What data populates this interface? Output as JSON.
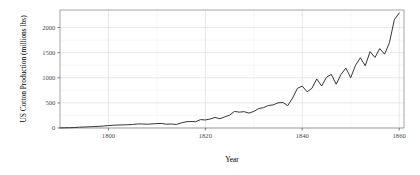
{
  "chart_data": {
    "type": "line",
    "title": "",
    "subtitle": "",
    "xlabel": "Year",
    "ylabel": "US Cotton Production (millions lbs)",
    "xlim": [
      1790,
      1861
    ],
    "ylim": [
      0,
      2350
    ],
    "xticks": [
      1800,
      1820,
      1840,
      1860
    ],
    "xtick_labels": [
      "1800",
      "1820",
      "1840",
      "1860"
    ],
    "yticks": [
      0,
      500,
      1000,
      1500,
      2000
    ],
    "ytick_labels": [
      "0",
      "500",
      "1000",
      "1500",
      "2000"
    ],
    "y_minor_ticks": [
      250,
      750,
      1250,
      1750,
      2250
    ],
    "x_minor_ticks": [
      1810,
      1830,
      1850
    ],
    "grid": true,
    "legend": "none",
    "series": [
      {
        "name": "US Cotton Production",
        "color": "#2b2b2b",
        "x": [
          1790,
          1791,
          1792,
          1793,
          1794,
          1795,
          1796,
          1797,
          1798,
          1799,
          1800,
          1801,
          1802,
          1803,
          1804,
          1805,
          1806,
          1807,
          1808,
          1809,
          1810,
          1811,
          1812,
          1813,
          1814,
          1815,
          1816,
          1817,
          1818,
          1819,
          1820,
          1821,
          1822,
          1823,
          1824,
          1825,
          1826,
          1827,
          1828,
          1829,
          1830,
          1831,
          1832,
          1833,
          1834,
          1835,
          1836,
          1837,
          1838,
          1839,
          1840,
          1841,
          1842,
          1843,
          1844,
          1845,
          1846,
          1847,
          1848,
          1849,
          1850,
          1851,
          1852,
          1853,
          1854,
          1855,
          1856,
          1857,
          1858,
          1859,
          1860
        ],
        "y": [
          2,
          4,
          6,
          10,
          16,
          20,
          24,
          28,
          32,
          40,
          48,
          55,
          60,
          62,
          65,
          70,
          80,
          80,
          75,
          82,
          88,
          90,
          75,
          80,
          70,
          100,
          124,
          130,
          125,
          167,
          160,
          180,
          210,
          185,
          220,
          255,
          330,
          316,
          325,
          296,
          331,
          386,
          406,
          448,
          460,
          501,
          508,
          445,
          596,
          790,
          835,
          720,
          791,
          977,
          837,
          1010,
          1067,
          871,
          1066,
          1194,
          1002,
          1250,
          1399,
          1240,
          1521,
          1405,
          1580,
          1470,
          1700,
          2155,
          2290
        ]
      }
    ]
  }
}
